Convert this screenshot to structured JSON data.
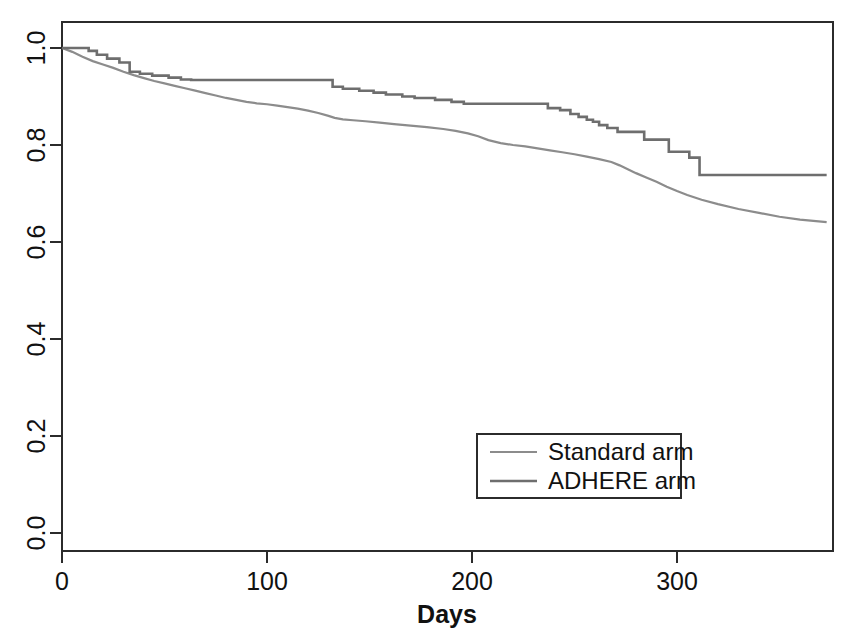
{
  "chart_data": {
    "type": "line",
    "title": "",
    "subtitle": "",
    "xlabel": "Days",
    "ylabel": "",
    "xlim": [
      0,
      376
    ],
    "ylim": [
      0.0,
      1.04
    ],
    "grid": false,
    "legend_position": "bottom-right",
    "xticks": [
      0,
      100,
      200,
      300
    ],
    "xtick_labels": [
      "0",
      "100",
      "200",
      "300"
    ],
    "yticks": [
      0.0,
      0.2,
      0.4,
      0.6,
      0.8,
      1.0
    ],
    "ytick_labels": [
      "0.0",
      "0.2",
      "0.4",
      "0.6",
      "0.8",
      "1.0"
    ],
    "annotations": [],
    "series": [
      {
        "name": "Standard arm",
        "color": "#8c8c8c",
        "linewidth": 2.2,
        "step": false,
        "x": [
          0,
          5,
          10,
          15,
          20,
          25,
          30,
          35,
          40,
          45,
          50,
          55,
          60,
          65,
          70,
          75,
          80,
          85,
          90,
          95,
          100,
          105,
          110,
          115,
          120,
          125,
          130,
          133,
          137,
          142,
          148,
          155,
          162,
          170,
          178,
          186,
          192,
          198,
          203,
          208,
          214,
          220,
          226,
          232,
          238,
          244,
          250,
          256,
          262,
          268,
          272,
          276,
          280,
          285,
          290,
          295,
          300,
          305,
          312,
          320,
          330,
          340,
          350,
          360,
          373
        ],
        "y": [
          1.0,
          0.992,
          0.982,
          0.973,
          0.966,
          0.959,
          0.951,
          0.944,
          0.938,
          0.932,
          0.927,
          0.922,
          0.917,
          0.912,
          0.907,
          0.902,
          0.897,
          0.893,
          0.889,
          0.886,
          0.884,
          0.881,
          0.878,
          0.875,
          0.871,
          0.866,
          0.86,
          0.856,
          0.853,
          0.851,
          0.849,
          0.846,
          0.843,
          0.84,
          0.837,
          0.833,
          0.829,
          0.824,
          0.818,
          0.81,
          0.804,
          0.8,
          0.797,
          0.793,
          0.789,
          0.785,
          0.781,
          0.776,
          0.771,
          0.765,
          0.758,
          0.75,
          0.742,
          0.733,
          0.724,
          0.714,
          0.705,
          0.697,
          0.687,
          0.678,
          0.668,
          0.66,
          0.652,
          0.646,
          0.641
        ]
      },
      {
        "name": "ADHERE arm",
        "color": "#6e6e6e",
        "linewidth": 2.6,
        "step": true,
        "x": [
          0,
          13,
          13,
          17,
          17,
          22,
          22,
          28,
          28,
          33,
          33,
          38,
          38,
          44,
          44,
          52,
          52,
          58,
          58,
          63,
          63,
          132,
          132,
          137,
          137,
          145,
          145,
          152,
          152,
          158,
          158,
          166,
          166,
          172,
          172,
          182,
          182,
          190,
          190,
          196,
          196,
          212,
          212,
          237,
          237,
          243,
          243,
          248,
          248,
          252,
          252,
          256,
          256,
          259,
          259,
          262,
          262,
          266,
          266,
          271,
          271,
          284,
          284,
          296,
          296,
          306,
          306,
          311,
          311,
          373
        ],
        "y": [
          1.0,
          1.0,
          0.994,
          0.994,
          0.986,
          0.986,
          0.978,
          0.978,
          0.97,
          0.97,
          0.951,
          0.951,
          0.947,
          0.947,
          0.943,
          0.943,
          0.939,
          0.939,
          0.935,
          0.935,
          0.934,
          0.934,
          0.92,
          0.92,
          0.916,
          0.916,
          0.912,
          0.912,
          0.908,
          0.908,
          0.904,
          0.904,
          0.9,
          0.9,
          0.897,
          0.897,
          0.893,
          0.893,
          0.889,
          0.889,
          0.885,
          0.885,
          0.885,
          0.885,
          0.876,
          0.876,
          0.872,
          0.872,
          0.864,
          0.864,
          0.858,
          0.858,
          0.852,
          0.852,
          0.848,
          0.848,
          0.841,
          0.841,
          0.835,
          0.835,
          0.827,
          0.827,
          0.811,
          0.811,
          0.786,
          0.786,
          0.774,
          0.774,
          0.738,
          0.738
        ]
      }
    ]
  },
  "axes": {
    "x_title": "Days",
    "xticks": [
      "0",
      "100",
      "200",
      "300"
    ],
    "yticks": [
      "0.0",
      "0.2",
      "0.4",
      "0.6",
      "0.8",
      "1.0"
    ]
  },
  "legend": {
    "entries": [
      {
        "label": "Standard arm",
        "color": "#8c8c8c"
      },
      {
        "label": "ADHERE arm",
        "color": "#6e6e6e"
      }
    ]
  },
  "colors": {
    "standard_arm": "#8c8c8c",
    "adhere_arm": "#6e6e6e",
    "axis": "#1a1a1a",
    "background": "#ffffff"
  }
}
